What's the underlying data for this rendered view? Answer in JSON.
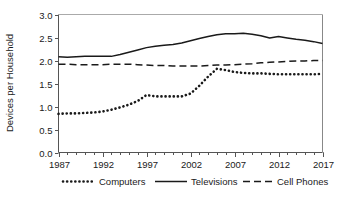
{
  "chart_data": {
    "type": "line",
    "title": "",
    "xlabel": "",
    "ylabel": "Devices per Household",
    "xlim": [
      1987,
      2017
    ],
    "ylim": [
      0.0,
      3.0
    ],
    "ytick_labels": [
      "0.0",
      "0.5",
      "1.0",
      "1.5",
      "2.0",
      "2.5",
      "3.0"
    ],
    "ytick_values": [
      0.0,
      0.5,
      1.0,
      1.5,
      2.0,
      2.5,
      3.0
    ],
    "xtick_labels": [
      "1987",
      "1992",
      "1997",
      "2002",
      "2007",
      "2012",
      "2017"
    ],
    "xtick_values": [
      1987,
      1992,
      1997,
      2002,
      2007,
      2012,
      2017
    ],
    "minor_xticks_every": 1,
    "grid": false,
    "legend_position": "below",
    "x": [
      1987,
      1988,
      1989,
      1990,
      1991,
      1992,
      1993,
      1994,
      1995,
      1996,
      1997,
      1998,
      1999,
      2000,
      2001,
      2002,
      2003,
      2004,
      2005,
      2006,
      2007,
      2008,
      2009,
      2010,
      2011,
      2012,
      2013,
      2014,
      2015,
      2016,
      2017
    ],
    "series": [
      {
        "name": "Computers",
        "style": "dotted",
        "color": "#1a1a1a",
        "values": [
          0.84,
          0.85,
          0.85,
          0.86,
          0.87,
          0.89,
          0.93,
          0.98,
          1.04,
          1.12,
          1.25,
          1.22,
          1.22,
          1.22,
          1.22,
          1.28,
          1.45,
          1.65,
          1.82,
          1.79,
          1.75,
          1.73,
          1.72,
          1.72,
          1.71,
          1.7,
          1.7,
          1.7,
          1.7,
          1.7,
          1.71
        ]
      },
      {
        "name": "Televisions",
        "style": "solid",
        "color": "#1a1a1a",
        "values": [
          2.08,
          2.07,
          2.08,
          2.09,
          2.09,
          2.09,
          2.09,
          2.13,
          2.18,
          2.23,
          2.28,
          2.31,
          2.33,
          2.35,
          2.38,
          2.43,
          2.48,
          2.52,
          2.56,
          2.58,
          2.58,
          2.59,
          2.57,
          2.54,
          2.49,
          2.52,
          2.49,
          2.46,
          2.44,
          2.41,
          2.37
        ]
      },
      {
        "name": "Cell Phones",
        "style": "dashed",
        "color": "#1a1a1a",
        "values": [
          1.92,
          1.92,
          1.91,
          1.91,
          1.91,
          1.91,
          1.92,
          1.92,
          1.92,
          1.91,
          1.9,
          1.89,
          1.89,
          1.88,
          1.88,
          1.88,
          1.88,
          1.89,
          1.9,
          1.9,
          1.91,
          1.92,
          1.93,
          1.95,
          1.96,
          1.97,
          1.98,
          1.99,
          1.99,
          2.0,
          2.0
        ]
      }
    ]
  },
  "legend": {
    "items": [
      {
        "label": "Computers",
        "style": "dotted"
      },
      {
        "label": "Televisions",
        "style": "solid"
      },
      {
        "label": "Cell Phones",
        "style": "dashed"
      }
    ]
  },
  "axes": {
    "y_title": "Devices per Household"
  }
}
